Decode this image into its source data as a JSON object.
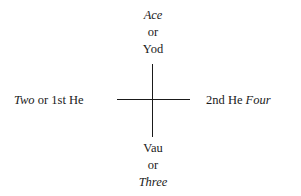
{
  "diagram": {
    "type": "cross",
    "top": {
      "label_italic": "Ace",
      "connector": "or",
      "label": "Yod"
    },
    "left": {
      "label_italic": "Two",
      "connector": "or",
      "label": "1st He"
    },
    "right": {
      "label": "2nd He",
      "label_italic": "Four"
    },
    "bottom": {
      "label": "Vau",
      "connector": "or",
      "label_italic": "Three"
    },
    "line_color": "#1a1a1a"
  }
}
